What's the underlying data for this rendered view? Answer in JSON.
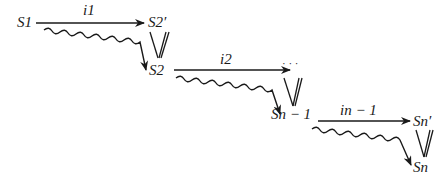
{
  "diagram": {
    "type": "state-transition-sequence",
    "nodes": {
      "s1": "S1",
      "s2_prime": "S2′",
      "s2": "S2",
      "ellipsis": "· · ·",
      "sn_minus_1": "Sn − 1",
      "sn_prime": "Sn′",
      "sn": "Sn"
    },
    "edge_labels": {
      "i1": "i1",
      "i2": "i2",
      "in_minus_1": "in − 1"
    },
    "edges": [
      {
        "from": "S1",
        "to": "S2′",
        "kind": "straight-arrow",
        "label": "i1"
      },
      {
        "from": "S1",
        "to": "S2",
        "kind": "wavy-arrow"
      },
      {
        "from": "S2′",
        "to": "S2",
        "kind": "double-line-equivalence"
      },
      {
        "from": "S2",
        "to": "· · ·",
        "kind": "straight-arrow",
        "label": "i2"
      },
      {
        "from": "S2",
        "to": "Sn − 1",
        "kind": "wavy-arrow"
      },
      {
        "from": "· · ·",
        "to": "Sn − 1",
        "kind": "double-line-equivalence"
      },
      {
        "from": "Sn − 1",
        "to": "Sn′",
        "kind": "straight-arrow",
        "label": "in − 1"
      },
      {
        "from": "Sn − 1",
        "to": "Sn",
        "kind": "wavy-arrow"
      },
      {
        "from": "Sn′",
        "to": "Sn",
        "kind": "double-line-equivalence"
      }
    ],
    "colors": {
      "ink": "#1a1a1a",
      "background": "#ffffff"
    }
  }
}
